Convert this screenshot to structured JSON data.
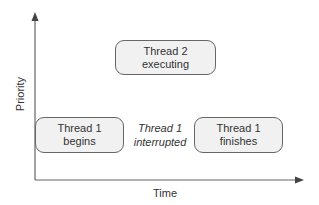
{
  "diagram": {
    "y_axis_label": "Priority",
    "x_axis_label": "Time",
    "boxes": [
      {
        "line1": "Thread 2",
        "line2": "executing"
      },
      {
        "line1": "Thread 1",
        "line2": "begins"
      },
      {
        "line1": "Thread 1",
        "line2": "finishes"
      }
    ],
    "annotation": {
      "line1": "Thread 1",
      "line2": "interrupted"
    }
  }
}
